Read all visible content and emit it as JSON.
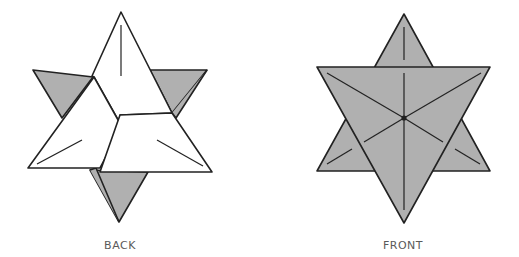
{
  "diagram": {
    "colors": {
      "gray_fill": "#b0b0b0",
      "white_fill": "#ffffff",
      "stroke": "#222222",
      "label": "#5a5a5a"
    },
    "views": [
      {
        "id": "back",
        "label": "BACK"
      },
      {
        "id": "front",
        "label": "FRONT"
      }
    ]
  }
}
